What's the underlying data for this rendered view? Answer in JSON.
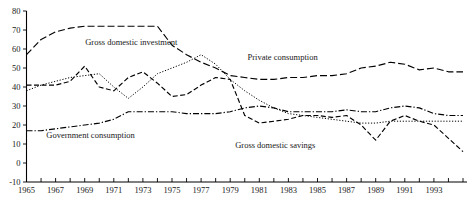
{
  "figure": {
    "title_fragment": "",
    "background": "#ffffff",
    "ink": "#000000"
  },
  "chart_data": {
    "type": "line",
    "title": "",
    "subtitle": "",
    "xlabel": "",
    "ylabel": "",
    "xlim": [
      1965,
      1995
    ],
    "ylim": [
      -10,
      80
    ],
    "yticks": [
      -10,
      0,
      10,
      20,
      30,
      40,
      50,
      60,
      70,
      80
    ],
    "ytick_labels": [
      "-10",
      "0",
      "10",
      "20",
      "30",
      "40",
      "50",
      "60",
      "70",
      "80"
    ],
    "xticks": [
      1965,
      1966,
      1967,
      1968,
      1969,
      1970,
      1971,
      1972,
      1973,
      1974,
      1975,
      1976,
      1977,
      1978,
      1979,
      1980,
      1981,
      1982,
      1983,
      1984,
      1985,
      1986,
      1987,
      1988,
      1989,
      1990,
      1991,
      1992,
      1993,
      1994,
      1995
    ],
    "xtick_labels_shown": [
      "1965",
      "1967",
      "1969",
      "1971",
      "1973",
      "1975",
      "1977",
      "1979",
      "1981",
      "1983",
      "1985",
      "1987",
      "1989",
      "1991",
      "1993"
    ],
    "grid": false,
    "legend": "inline-annotations",
    "x": [
      1965,
      1966,
      1967,
      1968,
      1969,
      1970,
      1971,
      1972,
      1973,
      1974,
      1975,
      1976,
      1977,
      1978,
      1979,
      1980,
      1981,
      1982,
      1983,
      1984,
      1985,
      1986,
      1987,
      1988,
      1989,
      1990,
      1991,
      1992,
      1993,
      1994,
      1995
    ],
    "series": [
      {
        "name": "Private consumption",
        "style": "long-dash",
        "label_x": 1982.6,
        "label_y": 54,
        "values": [
          57,
          65,
          69,
          71,
          72,
          72,
          72,
          72,
          72,
          72,
          62,
          57,
          53,
          50,
          46,
          45,
          44,
          44,
          45,
          45,
          46,
          46,
          47,
          50,
          51,
          53,
          52,
          49,
          50,
          48,
          48
        ]
      },
      {
        "name": "Gross domestic investment",
        "style": "dotted",
        "label_x": 1972.2,
        "label_y": 62,
        "values": [
          38,
          41,
          43,
          45,
          46,
          47,
          40,
          34,
          40,
          47,
          50,
          53,
          57,
          52,
          44,
          38,
          33,
          29,
          26,
          25,
          24,
          23,
          22,
          21,
          21,
          22,
          22,
          22,
          22,
          22,
          22
        ]
      },
      {
        "name": "Government consumption",
        "style": "dash-dot",
        "label_x": 1969.4,
        "label_y": 13,
        "values": [
          17,
          17,
          18,
          19,
          20,
          21,
          23,
          27,
          27,
          27,
          27,
          26,
          26,
          26,
          27,
          29,
          30,
          29,
          27,
          27,
          27,
          27,
          28,
          27,
          27,
          29,
          30,
          29,
          26,
          25,
          25
        ]
      },
      {
        "name": "Gross domestic savings",
        "style": "dash",
        "label_x": 1982.1,
        "label_y": 8,
        "values": [
          41,
          41,
          41,
          43,
          51,
          40,
          38,
          45,
          48,
          42,
          35,
          36,
          41,
          45,
          44,
          25,
          21,
          22,
          23,
          25,
          25,
          24,
          25,
          20,
          12,
          22,
          25,
          22,
          20,
          13,
          6
        ]
      }
    ]
  }
}
